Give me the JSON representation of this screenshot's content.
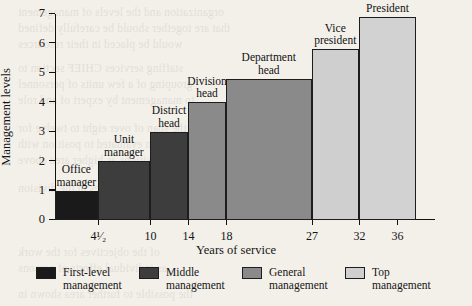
{
  "chart_data": {
    "type": "bar",
    "title": "",
    "xlabel": "Years of service",
    "ylabel": "Management levels",
    "ylim": [
      0,
      7
    ],
    "yticks": [
      0,
      1,
      2,
      3,
      4,
      5,
      6,
      7
    ],
    "ytick_labels": [
      "0",
      "1",
      "2",
      "3",
      "4",
      "5",
      "6",
      "7"
    ],
    "xlim": [
      0,
      40
    ],
    "xticks": [
      4.5,
      10,
      14,
      18,
      27,
      32,
      36
    ],
    "xtick_labels": [
      "4¹⁄₂",
      "10",
      "14",
      "18",
      "27",
      "32",
      "36"
    ],
    "grid": false,
    "legend_position": "bottom",
    "bars": [
      {
        "label": "Office\nmanager",
        "x_start": 0,
        "x_end": 4.5,
        "value": 1,
        "category": "First-level management",
        "color": "#1a1a1a"
      },
      {
        "label": "Unit\nmanager",
        "x_start": 4.5,
        "x_end": 10,
        "value": 2,
        "category": "Middle management",
        "color": "#3d3d3d"
      },
      {
        "label": "District\nhead",
        "x_start": 10,
        "x_end": 14,
        "value": 3,
        "category": "Middle management",
        "color": "#3d3d3d"
      },
      {
        "label": "Division\nhead",
        "x_start": 14,
        "x_end": 18,
        "value": 4,
        "category": "General management",
        "color": "#8a8a8a"
      },
      {
        "label": "Department\nhead",
        "x_start": 18,
        "x_end": 27,
        "value": 4.8,
        "category": "General management",
        "color": "#8a8a8a"
      },
      {
        "label": "Vice\npresident",
        "x_start": 27,
        "x_end": 32,
        "value": 5.8,
        "category": "Top management",
        "color": "#cfcfcf"
      },
      {
        "label": "President",
        "x_start": 32,
        "x_end": 38,
        "value": 6.9,
        "category": "Top management",
        "color": "#d2d2d2"
      }
    ],
    "legend": [
      {
        "label": "First-level\nmanagement",
        "color": "#1a1a1a"
      },
      {
        "label": "Middle\nmanagement",
        "color": "#3d3d3d"
      },
      {
        "label": "General\nmanagement",
        "color": "#8a8a8a"
      },
      {
        "label": "Top\nmanagement",
        "color": "#cfcfcf"
      }
    ]
  },
  "page": {
    "background_color": "#f3f0ea",
    "ink_color": "#151515"
  }
}
